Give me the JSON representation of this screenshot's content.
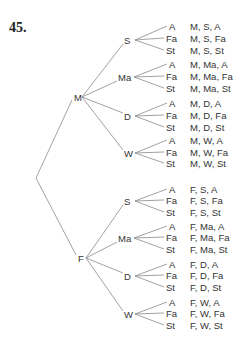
{
  "problem_number": "45.",
  "root": {
    "x": 36,
    "y": 178
  },
  "level1": [
    {
      "label": "M",
      "x": 78,
      "y": 97,
      "text_x": 74
    },
    {
      "label": "F",
      "x": 82,
      "y": 258,
      "text_x": 78
    }
  ],
  "level2_labels": [
    "S",
    "Ma",
    "D",
    "W"
  ],
  "level3_labels": [
    "A",
    "Fa",
    "St"
  ],
  "tree": [
    {
      "label": "M",
      "children": [
        {
          "label": "S",
          "y": 40,
          "leaves": [
            {
              "label": "A",
              "y": 26,
              "outcome": "M, S, A"
            },
            {
              "label": "Fa",
              "y": 38,
              "outcome": "M, S, Fa"
            },
            {
              "label": "St",
              "y": 50,
              "outcome": "M, S, St"
            }
          ]
        },
        {
          "label": "Ma",
          "y": 77,
          "leaves": [
            {
              "label": "A",
              "y": 64,
              "outcome": "M, Ma, A"
            },
            {
              "label": "Fa",
              "y": 76,
              "outcome": "M, Ma, Fa"
            },
            {
              "label": "St",
              "y": 88,
              "outcome": "M, Ma, St"
            }
          ]
        },
        {
          "label": "D",
          "y": 116,
          "leaves": [
            {
              "label": "A",
              "y": 103,
              "outcome": "M, D, A"
            },
            {
              "label": "Fa",
              "y": 115,
              "outcome": "M, D, Fa"
            },
            {
              "label": "St",
              "y": 127,
              "outcome": "M, D, St"
            }
          ]
        },
        {
          "label": "W",
          "y": 153,
          "leaves": [
            {
              "label": "A",
              "y": 140,
              "outcome": "M, W, A"
            },
            {
              "label": "Fa",
              "y": 152,
              "outcome": "M, W, Fa"
            },
            {
              "label": "St",
              "y": 163,
              "outcome": "M, W, St"
            }
          ]
        }
      ]
    },
    {
      "label": "F",
      "children": [
        {
          "label": "S",
          "y": 201,
          "leaves": [
            {
              "label": "A",
              "y": 189,
              "outcome": "F, S, A"
            },
            {
              "label": "Fa",
              "y": 200,
              "outcome": "F, S, Fa"
            },
            {
              "label": "St",
              "y": 212,
              "outcome": "F, S, St"
            }
          ]
        },
        {
          "label": "Ma",
          "y": 238,
          "leaves": [
            {
              "label": "A",
              "y": 226,
              "outcome": "F, Ma, A"
            },
            {
              "label": "Fa",
              "y": 237,
              "outcome": "F, Ma, Fa"
            },
            {
              "label": "St",
              "y": 249,
              "outcome": "F, Ma, St"
            }
          ]
        },
        {
          "label": "D",
          "y": 276,
          "leaves": [
            {
              "label": "A",
              "y": 264,
              "outcome": "F, D, A"
            },
            {
              "label": "Fa",
              "y": 275,
              "outcome": "F, D, Fa"
            },
            {
              "label": "St",
              "y": 287,
              "outcome": "F, D, St"
            }
          ]
        },
        {
          "label": "W",
          "y": 314,
          "leaves": [
            {
              "label": "A",
              "y": 302,
              "outcome": "F, W, A"
            },
            {
              "label": "Fa",
              "y": 313,
              "outcome": "F, W, Fa"
            },
            {
              "label": "St",
              "y": 325,
              "outcome": "F, W, St"
            }
          ]
        }
      ]
    }
  ],
  "colors": {
    "line": "#8a8a8a",
    "text": "#333333"
  }
}
